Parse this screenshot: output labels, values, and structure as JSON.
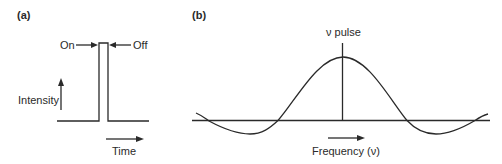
{
  "panel_a": {
    "label": "(a)",
    "title_on": "On",
    "title_off": "Off",
    "y_axis_label": "Intensity",
    "x_axis_label": "Time",
    "description": "Rectangular RF pulse: intensity switched on then off over a short time"
  },
  "panel_b": {
    "label": "(b)",
    "peak_label": "ν pulse",
    "x_axis_label": "Frequency (ν)",
    "description": "Frequency-domain excitation profile (sinc function) centered at the pulse frequency"
  },
  "colors": {
    "line": "#2a2a2a",
    "background": "#ffffff"
  }
}
